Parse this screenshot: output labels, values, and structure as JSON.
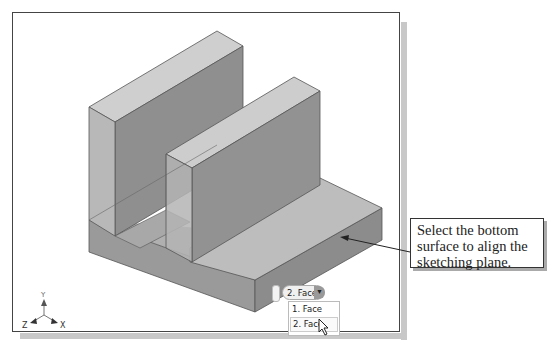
{
  "viewport": {
    "model": "3d-solid-bracket-isometric",
    "colors": {
      "light_face": "#c4c4c4",
      "mid_face": "#a6a6a6",
      "dark_face": "#8a8a8a",
      "edge": "#555555"
    }
  },
  "callout": {
    "text": "Select the bottom surface to align the sketching plane."
  },
  "selection_tool": {
    "current": "2. Face",
    "arrow_icon": "triangle-down",
    "options": [
      "1. Face",
      "2. Face"
    ],
    "highlighted_index": 1
  },
  "triad": {
    "x": "X",
    "y": "Y",
    "z": "Z"
  }
}
